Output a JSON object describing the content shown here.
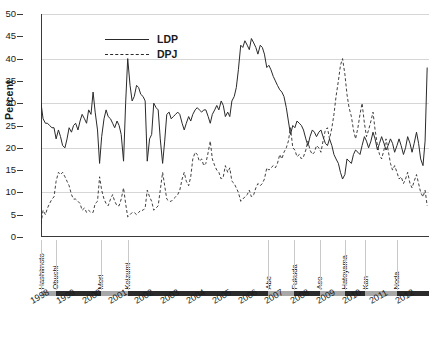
{
  "chart_data": {
    "type": "line",
    "title": "",
    "xlabel": "",
    "ylabel": "Percent",
    "ylim": [
      0,
      50
    ],
    "ytick_step": 5,
    "gridlines": [
      0,
      10,
      20,
      30,
      40,
      50
    ],
    "grid": true,
    "legend_position": "top-left",
    "xlim": [
      1998,
      2012.9
    ],
    "x_tick_labels": [
      "1998",
      "1999",
      "2000",
      "2001",
      "2002",
      "2003",
      "2004",
      "2005",
      "2006",
      "2007",
      "2008",
      "2009",
      "2010",
      "2011",
      "2012"
    ],
    "y_tick_labels": [
      "0",
      "5",
      "10",
      "15",
      "20",
      "25",
      "30",
      "35",
      "40",
      "45",
      "50"
    ],
    "series": [
      {
        "name": "LDP",
        "style": "solid",
        "color": "#2a2a2a",
        "x": [
          1998.0,
          1998.08,
          1998.17,
          1998.25,
          1998.33,
          1998.42,
          1998.5,
          1998.58,
          1998.67,
          1998.75,
          1998.83,
          1998.92,
          1999.0,
          1999.08,
          1999.17,
          1999.25,
          1999.33,
          1999.42,
          1999.5,
          1999.58,
          1999.67,
          1999.75,
          1999.83,
          1999.92,
          2000.0,
          2000.08,
          2000.17,
          2000.25,
          2000.33,
          2000.42,
          2000.5,
          2000.58,
          2000.67,
          2000.75,
          2000.83,
          2000.92,
          2001.0,
          2001.08,
          2001.17,
          2001.25,
          2001.33,
          2001.42,
          2001.5,
          2001.58,
          2001.67,
          2001.75,
          2001.83,
          2001.92,
          2002.0,
          2002.08,
          2002.17,
          2002.25,
          2002.33,
          2002.42,
          2002.5,
          2002.58,
          2002.67,
          2002.75,
          2002.83,
          2002.92,
          2003.0,
          2003.08,
          2003.17,
          2003.25,
          2003.33,
          2003.42,
          2003.5,
          2003.58,
          2003.67,
          2003.75,
          2003.83,
          2003.92,
          2004.0,
          2004.08,
          2004.17,
          2004.25,
          2004.33,
          2004.42,
          2004.5,
          2004.58,
          2004.67,
          2004.75,
          2004.83,
          2004.92,
          2005.0,
          2005.08,
          2005.17,
          2005.25,
          2005.33,
          2005.42,
          2005.5,
          2005.58,
          2005.67,
          2005.75,
          2005.83,
          2005.92,
          2006.0,
          2006.08,
          2006.17,
          2006.25,
          2006.33,
          2006.42,
          2006.5,
          2006.58,
          2006.67,
          2006.75,
          2006.83,
          2006.92,
          2007.0,
          2007.08,
          2007.17,
          2007.25,
          2007.33,
          2007.42,
          2007.5,
          2007.58,
          2007.67,
          2007.75,
          2007.83,
          2007.92,
          2008.0,
          2008.08,
          2008.17,
          2008.25,
          2008.33,
          2008.42,
          2008.5,
          2008.58,
          2008.67,
          2008.75,
          2008.83,
          2008.92,
          2009.0,
          2009.08,
          2009.17,
          2009.25,
          2009.33,
          2009.42,
          2009.5,
          2009.58,
          2009.67,
          2009.75,
          2009.83,
          2009.92,
          2010.0,
          2010.08,
          2010.17,
          2010.25,
          2010.33,
          2010.42,
          2010.5,
          2010.58,
          2010.67,
          2010.75,
          2010.83,
          2010.92,
          2011.0,
          2011.08,
          2011.17,
          2011.25,
          2011.33,
          2011.42,
          2011.5,
          2011.58,
          2011.67,
          2011.75,
          2011.83,
          2011.92,
          2012.0,
          2012.08,
          2012.17,
          2012.25,
          2012.33,
          2012.42,
          2012.5,
          2012.58,
          2012.67,
          2012.75,
          2012.83
        ],
        "y": [
          30.0,
          26.5,
          25.5,
          25.5,
          25.0,
          24.5,
          24.5,
          22.0,
          24.0,
          22.5,
          20.5,
          20.0,
          22.0,
          24.5,
          23.5,
          25.0,
          25.5,
          24.0,
          26.0,
          27.5,
          26.5,
          25.5,
          28.5,
          27.5,
          32.5,
          28.0,
          24.0,
          16.5,
          22.5,
          26.5,
          28.5,
          27.0,
          26.5,
          25.5,
          24.5,
          26.0,
          25.0,
          23.0,
          17.0,
          30.0,
          40.0,
          34.0,
          30.5,
          31.5,
          34.0,
          33.5,
          32.0,
          31.5,
          30.5,
          17.0,
          22.0,
          23.0,
          30.0,
          29.0,
          28.5,
          22.0,
          16.5,
          21.5,
          27.5,
          28.0,
          26.5,
          27.0,
          27.5,
          28.0,
          27.5,
          25.5,
          24.0,
          25.5,
          27.0,
          26.0,
          27.5,
          28.5,
          29.0,
          28.5,
          28.0,
          28.5,
          28.5,
          27.0,
          25.5,
          27.5,
          28.5,
          29.5,
          28.5,
          30.5,
          29.5,
          27.0,
          28.0,
          27.0,
          30.5,
          31.5,
          33.5,
          37.5,
          43.0,
          42.5,
          44.0,
          43.0,
          42.0,
          44.5,
          43.5,
          42.5,
          41.0,
          43.0,
          42.5,
          41.0,
          38.0,
          38.5,
          37.5,
          36.0,
          35.0,
          34.0,
          33.0,
          32.5,
          31.5,
          29.0,
          26.0,
          23.0,
          25.0,
          24.5,
          26.0,
          25.5,
          25.0,
          24.0,
          22.0,
          20.5,
          22.5,
          24.0,
          23.5,
          22.5,
          23.5,
          24.0,
          22.5,
          21.0,
          20.5,
          22.0,
          20.5,
          18.5,
          17.5,
          16.5,
          14.5,
          13.0,
          14.0,
          17.5,
          17.0,
          16.5,
          18.5,
          19.5,
          19.0,
          18.5,
          20.5,
          22.5,
          21.5,
          20.0,
          21.5,
          23.5,
          22.0,
          19.5,
          21.0,
          22.5,
          21.0,
          19.5,
          20.5,
          22.0,
          21.0,
          19.0,
          20.5,
          22.0,
          20.5,
          18.5,
          20.0,
          22.5,
          21.0,
          19.0,
          21.0,
          23.5,
          21.0,
          17.5,
          16.0,
          21.5,
          38.0
        ]
      },
      {
        "name": "DPJ",
        "style": "dashed",
        "color": "#2a2a2a",
        "x": [
          1998.0,
          1998.08,
          1998.17,
          1998.25,
          1998.33,
          1998.42,
          1998.5,
          1998.58,
          1998.67,
          1998.75,
          1998.83,
          1998.92,
          1999.0,
          1999.08,
          1999.17,
          1999.25,
          1999.33,
          1999.42,
          1999.5,
          1999.58,
          1999.67,
          1999.75,
          1999.83,
          1999.92,
          2000.0,
          2000.08,
          2000.17,
          2000.25,
          2000.33,
          2000.42,
          2000.5,
          2000.58,
          2000.67,
          2000.75,
          2000.83,
          2000.92,
          2001.0,
          2001.08,
          2001.17,
          2001.25,
          2001.33,
          2001.42,
          2001.5,
          2001.58,
          2001.67,
          2001.75,
          2001.83,
          2001.92,
          2002.0,
          2002.08,
          2002.17,
          2002.25,
          2002.33,
          2002.42,
          2002.5,
          2002.58,
          2002.67,
          2002.75,
          2002.83,
          2002.92,
          2003.0,
          2003.08,
          2003.17,
          2003.25,
          2003.33,
          2003.42,
          2003.5,
          2003.58,
          2003.67,
          2003.75,
          2003.83,
          2003.92,
          2004.0,
          2004.08,
          2004.17,
          2004.25,
          2004.33,
          2004.42,
          2004.5,
          2004.58,
          2004.67,
          2004.75,
          2004.83,
          2004.92,
          2005.0,
          2005.08,
          2005.17,
          2005.25,
          2005.33,
          2005.42,
          2005.5,
          2005.58,
          2005.67,
          2005.75,
          2005.83,
          2005.92,
          2006.0,
          2006.08,
          2006.17,
          2006.25,
          2006.33,
          2006.42,
          2006.5,
          2006.58,
          2006.67,
          2006.75,
          2006.83,
          2006.92,
          2007.0,
          2007.08,
          2007.17,
          2007.25,
          2007.33,
          2007.42,
          2007.5,
          2007.58,
          2007.67,
          2007.75,
          2007.83,
          2007.92,
          2008.0,
          2008.08,
          2008.17,
          2008.25,
          2008.33,
          2008.42,
          2008.5,
          2008.58,
          2008.67,
          2008.75,
          2008.83,
          2008.92,
          2009.0,
          2009.08,
          2009.17,
          2009.25,
          2009.33,
          2009.42,
          2009.5,
          2009.58,
          2009.67,
          2009.75,
          2009.83,
          2009.92,
          2010.0,
          2010.08,
          2010.17,
          2010.25,
          2010.33,
          2010.42,
          2010.5,
          2010.58,
          2010.67,
          2010.75,
          2010.83,
          2010.92,
          2011.0,
          2011.08,
          2011.17,
          2011.25,
          2011.33,
          2011.42,
          2011.5,
          2011.58,
          2011.67,
          2011.75,
          2011.83,
          2011.92,
          2012.0,
          2012.08,
          2012.17,
          2012.25,
          2012.33,
          2012.42,
          2012.5,
          2012.58,
          2012.67,
          2012.75,
          2012.83
        ],
        "y": [
          3.0,
          6.0,
          5.0,
          6.5,
          7.5,
          8.5,
          9.0,
          12.5,
          14.5,
          14.0,
          14.5,
          13.5,
          12.5,
          11.5,
          9.5,
          8.5,
          8.5,
          8.0,
          7.5,
          6.0,
          6.5,
          5.5,
          6.0,
          5.5,
          5.5,
          7.5,
          8.0,
          13.5,
          10.5,
          8.5,
          7.5,
          7.0,
          8.5,
          9.5,
          8.0,
          7.0,
          7.0,
          8.5,
          11.0,
          7.5,
          4.5,
          5.0,
          5.5,
          5.5,
          5.0,
          5.5,
          6.0,
          6.0,
          6.5,
          10.5,
          9.0,
          8.0,
          6.0,
          6.5,
          7.0,
          10.5,
          14.5,
          11.5,
          8.5,
          8.0,
          8.0,
          8.5,
          9.0,
          9.5,
          10.5,
          13.0,
          14.5,
          12.5,
          11.5,
          13.5,
          17.5,
          19.0,
          18.5,
          17.0,
          17.5,
          16.0,
          16.5,
          19.0,
          21.5,
          17.5,
          16.0,
          15.0,
          14.5,
          13.0,
          13.5,
          16.0,
          14.5,
          15.5,
          12.5,
          12.0,
          11.0,
          10.0,
          8.0,
          8.5,
          9.0,
          9.5,
          10.5,
          9.0,
          9.5,
          11.0,
          12.0,
          11.5,
          12.0,
          13.0,
          15.5,
          15.0,
          15.5,
          16.0,
          15.5,
          16.5,
          18.5,
          17.5,
          19.0,
          20.0,
          21.5,
          24.5,
          20.0,
          19.5,
          18.0,
          18.5,
          17.5,
          18.0,
          19.5,
          21.5,
          19.5,
          18.5,
          19.0,
          20.5,
          20.0,
          19.0,
          21.5,
          24.0,
          24.5,
          22.0,
          24.5,
          27.5,
          31.5,
          35.0,
          38.5,
          40.0,
          36.5,
          32.0,
          29.0,
          27.0,
          24.0,
          22.0,
          24.5,
          27.5,
          30.0,
          25.5,
          22.5,
          24.0,
          26.0,
          28.0,
          24.0,
          20.5,
          18.5,
          17.5,
          19.5,
          22.0,
          19.5,
          16.5,
          15.0,
          16.0,
          14.5,
          13.0,
          13.5,
          12.0,
          13.0,
          14.5,
          12.0,
          11.0,
          12.5,
          14.0,
          12.0,
          10.0,
          9.0,
          10.5,
          7.0
        ]
      }
    ],
    "pm_names": [
      "Hashimoto",
      "Obuchi",
      "Mori",
      "Koizumi",
      "Abe",
      "Fukuda",
      "Aso",
      "Hatoyama",
      "Kan",
      "Noda"
    ],
    "pm_terms": [
      {
        "name": "Hashimoto",
        "start": 1998.0,
        "end": 1998.56,
        "shade": "gray"
      },
      {
        "name": "Obuchi",
        "start": 1998.56,
        "end": 2000.29,
        "shade": "black"
      },
      {
        "name": "Mori",
        "start": 2000.29,
        "end": 2001.33,
        "shade": "gray"
      },
      {
        "name": "Koizumi",
        "start": 2001.33,
        "end": 2006.73,
        "shade": "black"
      },
      {
        "name": "Abe",
        "start": 2006.73,
        "end": 2007.73,
        "shade": "gray"
      },
      {
        "name": "Fukuda",
        "start": 2007.73,
        "end": 2008.71,
        "shade": "black"
      },
      {
        "name": "Aso",
        "start": 2008.71,
        "end": 2009.67,
        "shade": "gray"
      },
      {
        "name": "Hatoyama",
        "start": 2009.67,
        "end": 2010.46,
        "shade": "black"
      },
      {
        "name": "Kan",
        "start": 2010.46,
        "end": 2011.67,
        "shade": "gray"
      },
      {
        "name": "Noda",
        "start": 2011.67,
        "end": 2012.9,
        "shade": "black"
      }
    ]
  },
  "colors": {
    "ldp_line": "#2a2a2a",
    "dpj_line": "#2a2a2a",
    "gridline": "#d6d6d6",
    "axis": "#3a3a3a",
    "timeline_gray": "#a8a8a8",
    "timeline_black": "#2b2b2b",
    "background": "#ffffff"
  }
}
